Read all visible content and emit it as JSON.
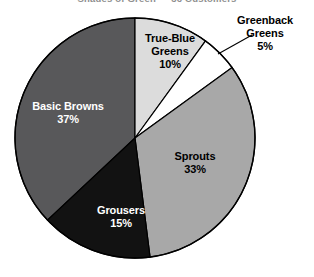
{
  "chart_data": {
    "type": "pie",
    "title": "Shades of Green — 36 Customers",
    "title_note": "clipped at top edge of screenshot",
    "start_angle_deg": 0,
    "direction": "clockwise",
    "legend": "none (direct slice labels)",
    "grid": false,
    "categories": [
      "True-Blue Greens",
      "Greenback Greens",
      "Sprouts",
      "Grousers",
      "Basic Browns"
    ],
    "values": [
      10,
      5,
      33,
      15,
      37
    ],
    "value_labels": [
      "10%",
      "5%",
      "33%",
      "15%",
      "37%"
    ],
    "colors": [
      "#dcdcdc",
      "#ffffff",
      "#a8a8a8",
      "#121212",
      "#58585a"
    ],
    "slices": [
      {
        "name": "True-Blue Greens",
        "value": 10,
        "value_label": "10%",
        "color": "#dcdcdc",
        "label_color": "#000000",
        "label_placement": "inside"
      },
      {
        "name": "Greenback Greens",
        "value": 5,
        "value_label": "5%",
        "color": "#ffffff",
        "label_color": "#000000",
        "label_placement": "outside-callout"
      },
      {
        "name": "Sprouts",
        "value": 33,
        "value_label": "33%",
        "color": "#a8a8a8",
        "label_color": "#000000",
        "label_placement": "inside"
      },
      {
        "name": "Grousers",
        "value": 15,
        "value_label": "15%",
        "color": "#121212",
        "label_color": "#ffffff",
        "label_placement": "inside"
      },
      {
        "name": "Basic Browns",
        "value": 37,
        "value_label": "37%",
        "color": "#58585a",
        "label_color": "#ffffff",
        "label_placement": "inside"
      }
    ]
  },
  "labels": {
    "basic_browns_name": "Basic Browns",
    "basic_browns_value": "37%",
    "sprouts_name": "Sprouts",
    "sprouts_value": "33%",
    "grousers_name": "Grousers",
    "grousers_value": "15%",
    "true_blue_name": "True-Blue",
    "true_blue_name2": "Greens",
    "true_blue_value": "10%",
    "greenback_name": "Greenback",
    "greenback_name2": "Greens",
    "greenback_value": "5%"
  }
}
